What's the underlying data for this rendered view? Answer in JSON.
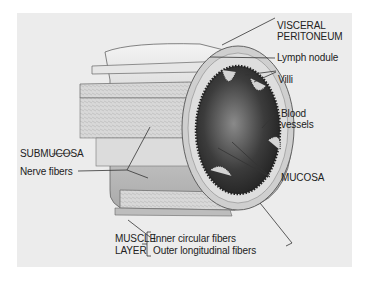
{
  "figure": {
    "background_color": "#ececec",
    "labels": {
      "visceral_peritoneum_1": "VISCERAL",
      "visceral_peritoneum_2": "PERITONEUM",
      "lymph_nodule": "Lymph nodule",
      "villi": "Villi",
      "blood_vessels_1": "Blood",
      "blood_vessels_2": "vessels",
      "mucosa": "MUCOSA",
      "submucosa": "SUBMUCOSA",
      "nerve_fibers": "Nerve fibers",
      "muscle_layer_1": "MUSCLE",
      "muscle_layer_2": "LAYER",
      "inner_circular": "Inner circular fibers",
      "outer_longitudinal": "Outer longitudinal fibers"
    }
  }
}
